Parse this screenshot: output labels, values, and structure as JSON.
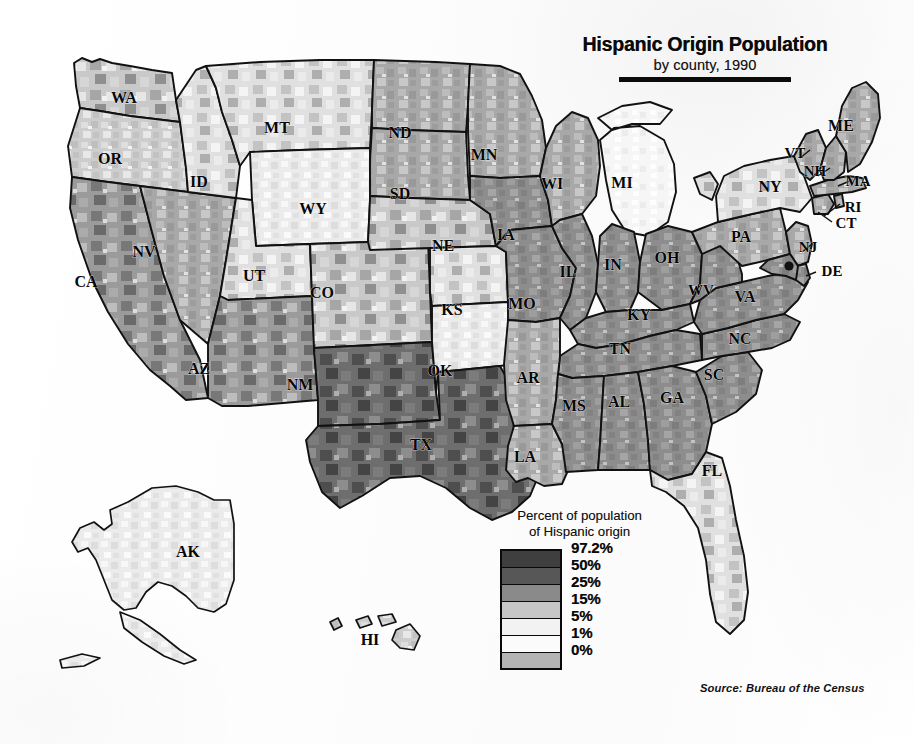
{
  "title": {
    "main": "Hispanic Origin Population",
    "subtitle": "by county, 1990"
  },
  "legend": {
    "caption_line1": "Percent of population",
    "caption_line2": "of Hispanic origin",
    "labels": [
      "97.2%",
      "50%",
      "25%",
      "15%",
      "5%",
      "1%",
      "0%"
    ],
    "swatch_colors": [
      "#3f3f3f",
      "#575757",
      "#8a8a8a",
      "#c6c6c6",
      "#f2f2f2",
      "#fbfbfb",
      "#b4b4b4"
    ]
  },
  "source": {
    "text": "Source:  Bureau of the Census"
  },
  "chart_data": {
    "type": "heatmap",
    "title": "Hispanic Origin Population",
    "subtitle": "by county, 1990",
    "xlabel": "",
    "ylabel": "",
    "variable": "Percent of population of Hispanic origin",
    "unit": "percent",
    "geography": "United States counties",
    "year": 1990,
    "source": "Bureau of the Census",
    "legend_position": "bottom-center",
    "grid": false,
    "class_breaks": [
      0,
      1,
      5,
      15,
      25,
      50,
      97.2
    ],
    "class_labels": [
      "0%",
      "1%",
      "5%",
      "15%",
      "25%",
      "50%",
      "97.2%"
    ],
    "class_colors": [
      "#b4b4b4",
      "#fbfbfb",
      "#f2f2f2",
      "#c6c6c6",
      "#8a8a8a",
      "#575757",
      "#3f3f3f"
    ],
    "categories": [
      "WA",
      "OR",
      "CA",
      "NV",
      "ID",
      "MT",
      "WY",
      "UT",
      "AZ",
      "CO",
      "NM",
      "ND",
      "SD",
      "NE",
      "KS",
      "OK",
      "TX",
      "MN",
      "IA",
      "MO",
      "AR",
      "LA",
      "WI",
      "IL",
      "MI",
      "IN",
      "OH",
      "KY",
      "TN",
      "MS",
      "AL",
      "GA",
      "FL",
      "SC",
      "NC",
      "VA",
      "WV",
      "PA",
      "NY",
      "NJ",
      "DE",
      "MD",
      "CT",
      "RI",
      "MA",
      "VT",
      "NH",
      "ME",
      "AK",
      "HI"
    ],
    "values": [
      4.4,
      4.0,
      25.8,
      10.4,
      5.3,
      1.5,
      5.7,
      4.9,
      18.8,
      12.9,
      38.2,
      0.7,
      0.8,
      2.3,
      3.8,
      2.7,
      25.5,
      1.2,
      1.2,
      1.2,
      0.8,
      2.2,
      1.9,
      7.9,
      2.2,
      1.8,
      1.3,
      0.6,
      0.7,
      0.6,
      0.6,
      1.7,
      12.2,
      0.9,
      1.2,
      2.6,
      0.5,
      2.0,
      12.3,
      9.6,
      2.4,
      2.6,
      6.5,
      4.6,
      4.8,
      0.7,
      1.0,
      0.6,
      3.2,
      7.3
    ],
    "series": [
      {
        "name": "Percent Hispanic origin, 1990",
        "values": [
          4.4,
          4.0,
          25.8,
          10.4,
          5.3,
          1.5,
          5.7,
          4.9,
          18.8,
          12.9,
          38.2,
          0.7,
          0.8,
          2.3,
          3.8,
          2.7,
          25.5,
          1.2,
          1.2,
          1.2,
          0.8,
          2.2,
          1.9,
          7.9,
          2.2,
          1.8,
          1.3,
          0.6,
          0.7,
          0.6,
          0.6,
          1.7,
          12.2,
          0.9,
          1.2,
          2.6,
          0.5,
          2.0,
          12.3,
          9.6,
          2.4,
          2.6,
          6.5,
          4.6,
          4.8,
          0.7,
          1.0,
          0.6,
          3.2,
          7.3
        ]
      }
    ],
    "annotations": [
      "Highest concentrations appear along the US-Mexico border in south Texas, New Mexico, Arizona and southern California.",
      "Maximum county value depicted: 97.2%",
      "Low shares (under 1%) dominate the Great Plains, Upper Midwest and much of the Southeast."
    ]
  },
  "states": [
    {
      "id": "WA",
      "label": "WA"
    },
    {
      "id": "OR",
      "label": "OR"
    },
    {
      "id": "CA",
      "label": "CA"
    },
    {
      "id": "NV",
      "label": "NV"
    },
    {
      "id": "ID",
      "label": "ID"
    },
    {
      "id": "MT",
      "label": "MT"
    },
    {
      "id": "WY",
      "label": "WY"
    },
    {
      "id": "UT",
      "label": "UT"
    },
    {
      "id": "AZ",
      "label": "AZ"
    },
    {
      "id": "CO",
      "label": "CO"
    },
    {
      "id": "NM",
      "label": "NM"
    },
    {
      "id": "ND",
      "label": "ND"
    },
    {
      "id": "SD",
      "label": "SD"
    },
    {
      "id": "NE",
      "label": "NE"
    },
    {
      "id": "KS",
      "label": "KS"
    },
    {
      "id": "OK",
      "label": "OK"
    },
    {
      "id": "TX",
      "label": "TX"
    },
    {
      "id": "MN",
      "label": "MN"
    },
    {
      "id": "IA",
      "label": "IA"
    },
    {
      "id": "MO",
      "label": "MO"
    },
    {
      "id": "AR",
      "label": "AR"
    },
    {
      "id": "LA",
      "label": "LA"
    },
    {
      "id": "WI",
      "label": "WI"
    },
    {
      "id": "IL",
      "label": "IL"
    },
    {
      "id": "MI",
      "label": "MI"
    },
    {
      "id": "IN",
      "label": "IN"
    },
    {
      "id": "OH",
      "label": "OH"
    },
    {
      "id": "KY",
      "label": "KY"
    },
    {
      "id": "TN",
      "label": "TN"
    },
    {
      "id": "MS",
      "label": "MS"
    },
    {
      "id": "AL",
      "label": "AL"
    },
    {
      "id": "GA",
      "label": "GA"
    },
    {
      "id": "FL",
      "label": "FL"
    },
    {
      "id": "SC",
      "label": "SC"
    },
    {
      "id": "NC",
      "label": "NC"
    },
    {
      "id": "VA",
      "label": "VA"
    },
    {
      "id": "WV",
      "label": "WV"
    },
    {
      "id": "PA",
      "label": "PA"
    },
    {
      "id": "NY",
      "label": "NY"
    },
    {
      "id": "NJ",
      "label": "NJ"
    },
    {
      "id": "DE",
      "label": "DE"
    },
    {
      "id": "CT",
      "label": "CT"
    },
    {
      "id": "RI",
      "label": "RI"
    },
    {
      "id": "MA",
      "label": "MA"
    },
    {
      "id": "VT",
      "label": "VT"
    },
    {
      "id": "NH",
      "label": "NH"
    },
    {
      "id": "ME",
      "label": "ME"
    },
    {
      "id": "AK",
      "label": "AK"
    },
    {
      "id": "HI",
      "label": "HI"
    }
  ]
}
